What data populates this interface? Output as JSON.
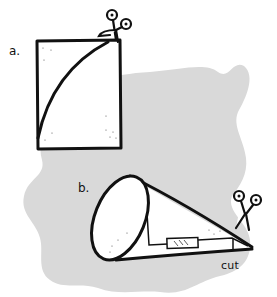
{
  "figure": {
    "colors": {
      "background": "#ffffff",
      "blob": "#d9d9d9",
      "ink": "#111111",
      "paper": "#ffffff"
    },
    "panel_a": {
      "label": "a.",
      "description": "rectangle of paper with curved cutting line, scissors at top"
    },
    "panel_b": {
      "label": "b.",
      "description": "paper rolled into a cone with tape; scissors trimming the tip",
      "cut_label": "cut"
    }
  }
}
